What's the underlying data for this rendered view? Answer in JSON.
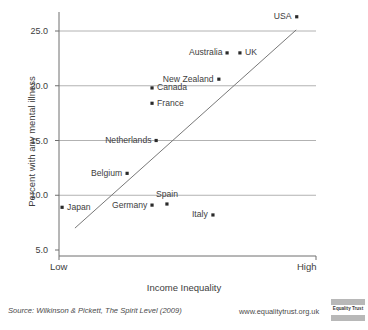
{
  "chart_data": {
    "type": "scatter",
    "title": "",
    "xlabel": "Income Inequality",
    "ylabel": "Percent with any mental illness",
    "xtick_labels": [
      "Low",
      "High"
    ],
    "ytick_labels": [
      "5.0",
      "10.0",
      "15.0",
      "20.0",
      "25.0"
    ],
    "ylim": [
      5.0,
      26.5
    ],
    "ytick_values": [
      5.0,
      10.0,
      15.0,
      20.0,
      25.0
    ],
    "grid": "horizontal",
    "legend": "none",
    "trendline": {
      "present": true,
      "label": "linear fit",
      "x_start_frac": 0.062,
      "y_start_value": 7.0,
      "x_end_frac": 0.923,
      "y_end_value": 25.1
    },
    "points": [
      {
        "label": "Japan",
        "x_frac": 0.012,
        "y": 8.9,
        "label_pos": "right"
      },
      {
        "label": "Belgium",
        "x_frac": 0.265,
        "y": 12.0,
        "label_pos": "left"
      },
      {
        "label": "Germany",
        "x_frac": 0.362,
        "y": 9.1,
        "label_pos": "left"
      },
      {
        "label": "Netherlands",
        "x_frac": 0.378,
        "y": 15.0,
        "label_pos": "left"
      },
      {
        "label": "France",
        "x_frac": 0.362,
        "y": 18.4,
        "label_pos": "right"
      },
      {
        "label": "Canada",
        "x_frac": 0.362,
        "y": 19.8,
        "label_pos": "right"
      },
      {
        "label": "Spain",
        "x_frac": 0.42,
        "y": 9.2,
        "label_pos": "above"
      },
      {
        "label": "Italy",
        "x_frac": 0.599,
        "y": 8.2,
        "label_pos": "left"
      },
      {
        "label": "New Zealand",
        "x_frac": 0.622,
        "y": 20.6,
        "label_pos": "left"
      },
      {
        "label": "Australia",
        "x_frac": 0.654,
        "y": 23.0,
        "label_pos": "left"
      },
      {
        "label": "UK",
        "x_frac": 0.704,
        "y": 23.0,
        "label_pos": "right"
      },
      {
        "label": "USA",
        "x_frac": 0.925,
        "y": 26.3,
        "label_pos": "left"
      }
    ],
    "colors": {
      "point": "#2a2a2a",
      "grid": "#a9a9a9",
      "axis": "#6e6e6e",
      "trendline": "#787878",
      "text": "#3d3d3d"
    }
  },
  "footer": {
    "source": "Source: Wilkinson & Pickett, The Spirit Level (2009)",
    "url": "www.equalitytrust.org.uk",
    "logo_text": "Equality Trust"
  }
}
